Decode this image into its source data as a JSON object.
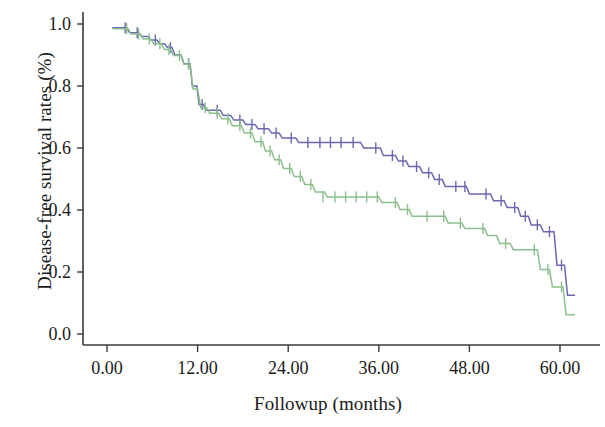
{
  "chart_data": {
    "type": "line",
    "plot_kind": "kaplan-meier-survival",
    "title": "",
    "xlabel": "Followup (months)",
    "ylabel": "Disease-free survival rates (%)",
    "xlim": [
      0,
      63
    ],
    "ylim": [
      0,
      1.05
    ],
    "xticks": [
      0,
      12,
      24,
      36,
      48,
      60
    ],
    "xtick_labels": [
      "0.00",
      "12.00",
      "24.00",
      "36.00",
      "48.00",
      "60.00"
    ],
    "yticks": [
      0.0,
      0.2,
      0.4,
      0.6,
      0.8,
      1.0
    ],
    "ytick_labels": [
      "0.0",
      "0.2",
      "0.4",
      "0.6",
      "0.8",
      "1.0"
    ],
    "grid": false,
    "legend": "none",
    "censor_marker": "plus-tick",
    "colors": {
      "series_blue": "#6a68b0",
      "series_green": "#8cbf8c",
      "axis": "#3a3a3a",
      "text": "#1a1a1a",
      "background": "#ffffff"
    },
    "series": [
      {
        "name": "series-blue",
        "color": "#6a68b0",
        "points": [
          [
            0.7,
            0.988
          ],
          [
            2.6,
            0.988
          ],
          [
            3.0,
            0.972
          ],
          [
            4.2,
            0.972
          ],
          [
            4.6,
            0.96
          ],
          [
            5.4,
            0.96
          ],
          [
            5.8,
            0.948
          ],
          [
            6.6,
            0.948
          ],
          [
            7.0,
            0.936
          ],
          [
            7.6,
            0.936
          ],
          [
            8.0,
            0.924
          ],
          [
            8.6,
            0.924
          ],
          [
            9.0,
            0.9
          ],
          [
            9.8,
            0.9
          ],
          [
            10.2,
            0.872
          ],
          [
            11.0,
            0.872
          ],
          [
            11.3,
            0.8
          ],
          [
            11.9,
            0.8
          ],
          [
            12.2,
            0.74
          ],
          [
            12.8,
            0.74
          ],
          [
            13.1,
            0.722
          ],
          [
            15.0,
            0.722
          ],
          [
            15.4,
            0.705
          ],
          [
            16.4,
            0.705
          ],
          [
            16.8,
            0.69
          ],
          [
            18.0,
            0.69
          ],
          [
            18.4,
            0.676
          ],
          [
            19.6,
            0.676
          ],
          [
            20.0,
            0.662
          ],
          [
            21.4,
            0.662
          ],
          [
            21.8,
            0.648
          ],
          [
            22.8,
            0.648
          ],
          [
            23.2,
            0.632
          ],
          [
            25.0,
            0.632
          ],
          [
            25.4,
            0.618
          ],
          [
            33.6,
            0.618
          ],
          [
            34.0,
            0.6
          ],
          [
            36.2,
            0.6
          ],
          [
            36.6,
            0.576
          ],
          [
            38.2,
            0.576
          ],
          [
            38.6,
            0.558
          ],
          [
            39.6,
            0.558
          ],
          [
            40.0,
            0.54
          ],
          [
            41.4,
            0.54
          ],
          [
            41.8,
            0.52
          ],
          [
            43.0,
            0.52
          ],
          [
            43.4,
            0.498
          ],
          [
            44.4,
            0.498
          ],
          [
            44.8,
            0.476
          ],
          [
            47.6,
            0.476
          ],
          [
            48.0,
            0.452
          ],
          [
            50.8,
            0.452
          ],
          [
            51.2,
            0.43
          ],
          [
            52.6,
            0.43
          ],
          [
            53.0,
            0.408
          ],
          [
            54.4,
            0.408
          ],
          [
            54.8,
            0.38
          ],
          [
            55.8,
            0.38
          ],
          [
            56.2,
            0.352
          ],
          [
            57.4,
            0.352
          ],
          [
            57.8,
            0.33
          ],
          [
            59.2,
            0.33
          ],
          [
            59.6,
            0.222
          ],
          [
            60.6,
            0.222
          ],
          [
            61.0,
            0.125
          ],
          [
            62.0,
            0.125
          ]
        ],
        "censor_x": [
          2.4,
          4.0,
          6.4,
          8.4,
          10.8,
          12.6,
          14.6,
          17.6,
          19.2,
          20.8,
          22.4,
          24.4,
          26.6,
          28.2,
          29.6,
          31.0,
          32.6,
          35.6,
          37.8,
          39.2,
          41.0,
          42.6,
          44.0,
          46.2,
          47.4,
          50.2,
          52.2,
          54.0,
          55.4,
          57.0,
          58.6,
          60.2
        ],
        "censor_y": [
          0.988,
          0.972,
          0.948,
          0.924,
          0.872,
          0.74,
          0.722,
          0.69,
          0.676,
          0.662,
          0.648,
          0.632,
          0.618,
          0.618,
          0.618,
          0.618,
          0.618,
          0.6,
          0.576,
          0.558,
          0.54,
          0.52,
          0.498,
          0.476,
          0.476,
          0.452,
          0.43,
          0.408,
          0.38,
          0.352,
          0.33,
          0.222
        ]
      },
      {
        "name": "series-green",
        "color": "#8cbf8c",
        "points": [
          [
            0.7,
            0.985
          ],
          [
            2.8,
            0.985
          ],
          [
            3.2,
            0.968
          ],
          [
            4.4,
            0.968
          ],
          [
            4.8,
            0.952
          ],
          [
            5.8,
            0.952
          ],
          [
            6.2,
            0.936
          ],
          [
            7.2,
            0.936
          ],
          [
            7.6,
            0.918
          ],
          [
            8.4,
            0.918
          ],
          [
            8.8,
            0.898
          ],
          [
            9.8,
            0.898
          ],
          [
            10.2,
            0.87
          ],
          [
            11.0,
            0.87
          ],
          [
            11.4,
            0.79
          ],
          [
            12.0,
            0.79
          ],
          [
            12.4,
            0.73
          ],
          [
            13.2,
            0.73
          ],
          [
            13.6,
            0.712
          ],
          [
            14.8,
            0.712
          ],
          [
            15.2,
            0.694
          ],
          [
            16.2,
            0.694
          ],
          [
            16.6,
            0.672
          ],
          [
            17.8,
            0.672
          ],
          [
            18.2,
            0.648
          ],
          [
            19.2,
            0.648
          ],
          [
            19.6,
            0.62
          ],
          [
            20.6,
            0.62
          ],
          [
            21.0,
            0.59
          ],
          [
            21.8,
            0.59
          ],
          [
            22.2,
            0.562
          ],
          [
            23.0,
            0.562
          ],
          [
            23.4,
            0.534
          ],
          [
            24.4,
            0.534
          ],
          [
            24.8,
            0.508
          ],
          [
            25.8,
            0.508
          ],
          [
            26.2,
            0.482
          ],
          [
            27.2,
            0.482
          ],
          [
            27.6,
            0.458
          ],
          [
            28.8,
            0.458
          ],
          [
            29.2,
            0.442
          ],
          [
            36.0,
            0.442
          ],
          [
            36.4,
            0.424
          ],
          [
            38.4,
            0.424
          ],
          [
            38.8,
            0.402
          ],
          [
            40.0,
            0.402
          ],
          [
            40.4,
            0.38
          ],
          [
            44.8,
            0.38
          ],
          [
            45.2,
            0.358
          ],
          [
            47.0,
            0.358
          ],
          [
            47.4,
            0.34
          ],
          [
            50.0,
            0.34
          ],
          [
            50.4,
            0.318
          ],
          [
            51.6,
            0.318
          ],
          [
            52.0,
            0.292
          ],
          [
            53.4,
            0.292
          ],
          [
            53.8,
            0.272
          ],
          [
            57.0,
            0.272
          ],
          [
            57.4,
            0.208
          ],
          [
            58.6,
            0.208
          ],
          [
            59.0,
            0.152
          ],
          [
            60.4,
            0.152
          ],
          [
            60.8,
            0.062
          ],
          [
            62.0,
            0.062
          ]
        ],
        "censor_x": [
          2.6,
          4.2,
          5.6,
          7.0,
          8.2,
          9.6,
          10.8,
          13.0,
          14.6,
          16.0,
          17.6,
          19.0,
          20.4,
          21.6,
          22.8,
          24.2,
          25.6,
          27.0,
          28.6,
          30.2,
          31.6,
          33.0,
          34.4,
          35.8,
          38.2,
          39.8,
          42.4,
          44.6,
          46.8,
          49.8,
          52.8,
          56.6,
          58.4,
          60.2
        ],
        "censor_y": [
          0.985,
          0.968,
          0.952,
          0.936,
          0.918,
          0.898,
          0.87,
          0.73,
          0.712,
          0.694,
          0.672,
          0.648,
          0.62,
          0.59,
          0.562,
          0.534,
          0.508,
          0.482,
          0.442,
          0.442,
          0.442,
          0.442,
          0.442,
          0.442,
          0.424,
          0.402,
          0.38,
          0.38,
          0.358,
          0.34,
          0.292,
          0.272,
          0.208,
          0.152
        ]
      }
    ]
  }
}
